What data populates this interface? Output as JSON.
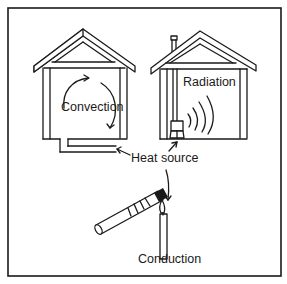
{
  "diagram": {
    "labels": {
      "convection": "Convection",
      "radiation": "Radiation",
      "heat_source": "Heat source",
      "conduction": "Conduction"
    },
    "colors": {
      "line": "#1a1a1a",
      "background": "#ffffff"
    }
  }
}
